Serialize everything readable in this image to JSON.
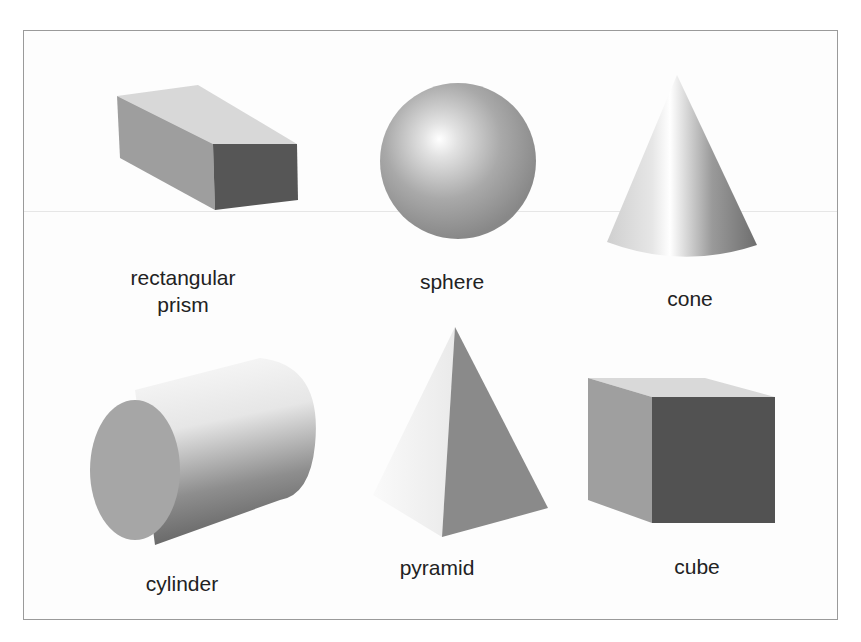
{
  "diagram": {
    "title": "",
    "shapes": [
      {
        "id": "rectangular-prism",
        "label_line1": "rectangular",
        "label_line2": "prism"
      },
      {
        "id": "sphere",
        "label": "sphere"
      },
      {
        "id": "cone",
        "label": "cone"
      },
      {
        "id": "cylinder",
        "label": "cylinder"
      },
      {
        "id": "pyramid",
        "label": "pyramid"
      },
      {
        "id": "cube",
        "label": "cube"
      }
    ],
    "colors": {
      "light_face": "#d9d9d9",
      "mid_face": "#9c9c9c",
      "dark_face": "#555555",
      "border": "#9a9a9a",
      "text": "#222222"
    }
  }
}
